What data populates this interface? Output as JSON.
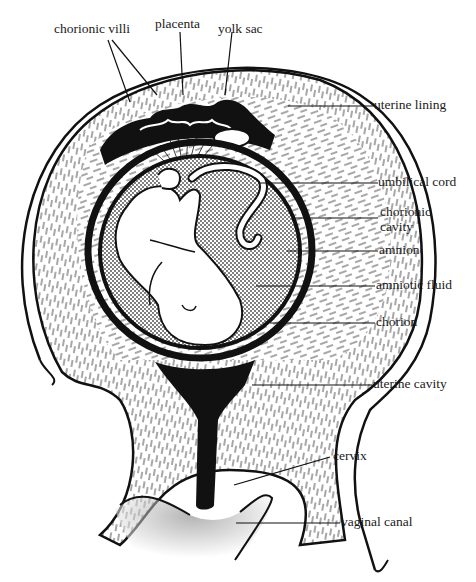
{
  "diagram": {
    "labels": {
      "chorionic_villi": "chorionic villi",
      "placenta": "placenta",
      "yolk_sac": "yolk sac",
      "uterine_lining": "uterine lining",
      "umbilical_cord": "umbilical cord",
      "chorionic_cavity_line1": "chorionic",
      "chorionic_cavity_line2": "cavity",
      "amnion": "amnion",
      "amniotic_fluid": "amniotic fluid",
      "chorion": "chorion",
      "uterine_cavity": "uterine cavity",
      "cervix": "cervix",
      "vaginal_canal": "vaginal canal"
    },
    "colors": {
      "ink": "#111111",
      "paper": "#ffffff",
      "stipple": "#bdbdbd"
    }
  }
}
